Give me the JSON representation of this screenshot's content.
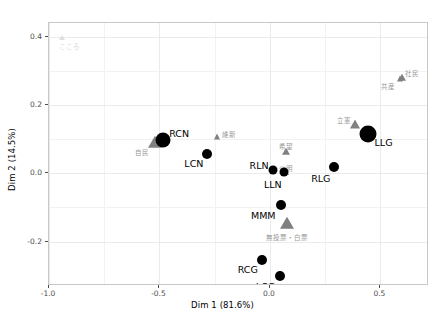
{
  "chart_data": {
    "type": "scatter",
    "title": "",
    "xlabel": "Dim 1 (81.6%)",
    "ylabel": "Dim 2 (14.5%)",
    "xlim": [
      -1.0,
      0.72
    ],
    "ylim": [
      -0.33,
      0.44
    ],
    "xticks": [
      "-1.0",
      "-0.5",
      "0.0",
      "0.5"
    ],
    "xtick_values": [
      -1.0,
      -0.5,
      0.0,
      0.5
    ],
    "yticks": [
      "0.4",
      "0.2",
      "0.0",
      "-0.2"
    ],
    "ytick_values": [
      0.4,
      0.2,
      0.0,
      -0.2
    ],
    "grid": true,
    "legend": "none",
    "series": [
      {
        "name": "individuals",
        "marker": "circle",
        "color": "#000000",
        "points": [
          {
            "label": "RCN",
            "x": -0.483,
            "y": 0.096,
            "size": 7.5,
            "label_dx": 6,
            "label_dy": -6
          },
          {
            "label": "LCN",
            "x": -0.283,
            "y": 0.057,
            "size": 5.0,
            "label_dx": -4,
            "label_dy": 10,
            "label_anchor": "end"
          },
          {
            "label": "RLN",
            "x": 0.012,
            "y": 0.009,
            "size": 4.5,
            "label_dx": -4,
            "label_dy": -4,
            "label_anchor": "end"
          },
          {
            "label": "LLN",
            "x": 0.062,
            "y": 0.003,
            "size": 4.5,
            "label_dx": -2,
            "label_dy": 13,
            "label_anchor": "end"
          },
          {
            "label": "RLG",
            "x": 0.292,
            "y": 0.018,
            "size": 5.0,
            "label_dx": -4,
            "label_dy": 12,
            "label_anchor": "end"
          },
          {
            "label": "LLG",
            "x": 0.442,
            "y": 0.114,
            "size": 8.5,
            "label_dx": 7,
            "label_dy": 9
          },
          {
            "label": "MMM",
            "x": 0.048,
            "y": -0.092,
            "size": 5.0,
            "label_dx": -5,
            "label_dy": 11,
            "label_anchor": "end"
          },
          {
            "label": "RCG",
            "x": -0.037,
            "y": -0.254,
            "size": 5.0,
            "label_dx": -4,
            "label_dy": 10,
            "label_anchor": "end"
          },
          {
            "label": "LCG",
            "x": 0.046,
            "y": -0.302,
            "size": 5.0,
            "label_dx": -5,
            "label_dy": 11,
            "label_anchor": "end"
          }
        ]
      },
      {
        "name": "variables",
        "marker": "triangle",
        "color": "#808080",
        "points": [
          {
            "label": "こころ",
            "x": -0.94,
            "y": 0.397,
            "size": 3.5,
            "label_dx": -3,
            "label_dy": 9,
            "faint": true
          },
          {
            "label": "自民",
            "x": -0.518,
            "y": 0.089,
            "size": 7.5,
            "label_dx": -6,
            "label_dy": 10,
            "label_anchor": "end"
          },
          {
            "label": "維新",
            "x": -0.241,
            "y": 0.107,
            "size": 4.0,
            "label_dx": 5,
            "label_dy": -2
          },
          {
            "label": "希望",
            "x": 0.074,
            "y": 0.063,
            "size": 4.5,
            "label_dx": 0,
            "label_dy": -5,
            "label_anchor": "middle"
          },
          {
            "label": "公明",
            "x": 0.072,
            "y": 0.002,
            "size": 3.5,
            "label_dx": 0,
            "label_dy": -4,
            "label_anchor": "middle"
          },
          {
            "label": "立憲",
            "x": 0.383,
            "y": 0.141,
            "size": 6.0,
            "label_dx": -4,
            "label_dy": -4,
            "label_anchor": "end"
          },
          {
            "label": "社民",
            "x": 0.596,
            "y": 0.279,
            "size": 4.5,
            "label_dx": 3,
            "label_dy": -4
          },
          {
            "label": "共産",
            "x": 0.589,
            "y": 0.276,
            "size": 4.0,
            "label_dx": -5,
            "label_dy": 8,
            "label_anchor": "end"
          },
          {
            "label": "無投票・白票",
            "x": 0.078,
            "y": -0.148,
            "size": 8.0,
            "label_dx": 0,
            "label_dy": 14,
            "label_anchor": "middle"
          }
        ]
      }
    ]
  },
  "colors": {
    "individual_marker": "#000000",
    "variable_marker": "#808080",
    "variable_label": "#999999",
    "gridline": "#ebebeb",
    "panel_border": "#c8c8c8",
    "axis_text": "#4d4d4d",
    "background": "#ffffff"
  }
}
